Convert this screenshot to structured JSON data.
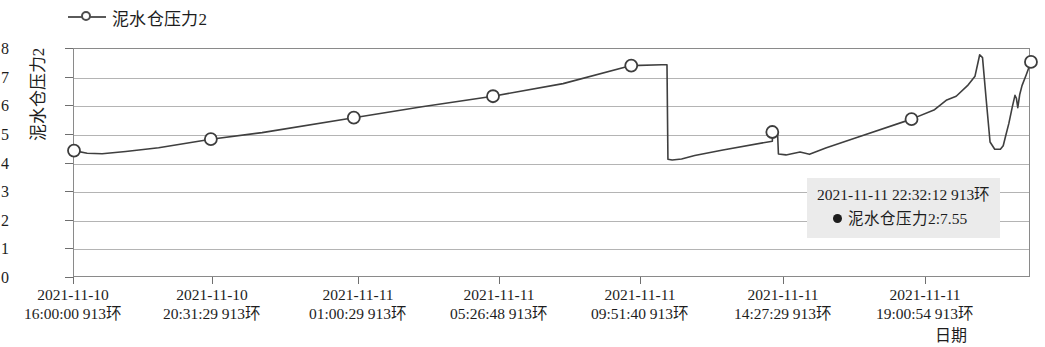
{
  "legend": {
    "items": [
      {
        "label": "泥水仓压力2",
        "marker": "line-circle-marker",
        "color": "#4d4d4d"
      }
    ]
  },
  "axes": {
    "y_title": "泥水仓压力2",
    "x_title": "日期",
    "y_ticks": [
      "0",
      "1",
      "2",
      "3",
      "4",
      "5",
      "6",
      "7",
      "8"
    ],
    "x_ticks": [
      {
        "line1": "2021-11-10",
        "line2": "16:00:00  913环"
      },
      {
        "line1": "2021-11-10",
        "line2": "20:31:29  913环"
      },
      {
        "line1": "2021-11-11",
        "line2": "01:00:29  913环"
      },
      {
        "line1": "2021-11-11",
        "line2": "05:26:48  913环"
      },
      {
        "line1": "2021-11-11",
        "line2": "09:51:40  913环"
      },
      {
        "line1": "2021-11-11",
        "line2": "14:27:29  913环"
      },
      {
        "line1": "2021-11-11",
        "line2": "19:00:54  913环"
      }
    ]
  },
  "tooltip": {
    "header": "2021-11-11  22:32:12  913环",
    "series_name": "泥水仓压力2",
    "value": "7.55",
    "body": "泥水仓压力2:7.55",
    "background": "#ebebeb"
  },
  "chart_data": {
    "type": "line",
    "title": "",
    "xlabel": "日期",
    "ylabel": "泥水仓压力2",
    "ylim": [
      0,
      8
    ],
    "ytick_values": [
      0,
      1,
      2,
      3,
      4,
      5,
      6,
      7,
      8
    ],
    "grid": true,
    "legend_position": "top-left",
    "categories": [
      "2021-11-10 16:00:00 913环",
      "2021-11-10 20:31:29 913环",
      "2021-11-11 01:00:29 913环",
      "2021-11-11 05:26:48 913环",
      "2021-11-11 09:51:40 913环",
      "2021-11-11 14:27:29 913环",
      "2021-11-11 19:00:54 913环"
    ],
    "series": [
      {
        "name": "泥水仓压力2",
        "color": "#3f3f3f",
        "marker_values": [
          4.45,
          4.85,
          5.6,
          6.35,
          7.42,
          5.1,
          5.55
        ],
        "x_fraction": [
          0.0,
          0.1455,
          0.2975,
          0.4455,
          0.5925,
          0.7425,
          0.8905
        ],
        "points": [
          {
            "t": 0.0,
            "v": 4.45
          },
          {
            "t": 0.014,
            "v": 4.36
          },
          {
            "t": 0.03,
            "v": 4.34
          },
          {
            "t": 0.055,
            "v": 4.42
          },
          {
            "t": 0.09,
            "v": 4.55
          },
          {
            "t": 0.1455,
            "v": 4.85
          },
          {
            "t": 0.2,
            "v": 5.08
          },
          {
            "t": 0.2975,
            "v": 5.6
          },
          {
            "t": 0.37,
            "v": 5.98
          },
          {
            "t": 0.4455,
            "v": 6.35
          },
          {
            "t": 0.52,
            "v": 6.79
          },
          {
            "t": 0.5925,
            "v": 7.42
          },
          {
            "t": 0.625,
            "v": 7.45
          },
          {
            "t": 0.6305,
            "v": 7.45
          },
          {
            "t": 0.6315,
            "v": 4.15
          },
          {
            "t": 0.636,
            "v": 4.12
          },
          {
            "t": 0.646,
            "v": 4.16
          },
          {
            "t": 0.66,
            "v": 4.28
          },
          {
            "t": 0.69,
            "v": 4.47
          },
          {
            "t": 0.7425,
            "v": 4.78
          },
          {
            "t": 0.743,
            "v": 5.1
          },
          {
            "t": 0.748,
            "v": 5.12
          },
          {
            "t": 0.749,
            "v": 4.33
          },
          {
            "t": 0.757,
            "v": 4.3
          },
          {
            "t": 0.772,
            "v": 4.4
          },
          {
            "t": 0.782,
            "v": 4.32
          },
          {
            "t": 0.8,
            "v": 4.55
          },
          {
            "t": 0.83,
            "v": 4.88
          },
          {
            "t": 0.8905,
            "v": 5.55
          },
          {
            "t": 0.915,
            "v": 5.88
          },
          {
            "t": 0.928,
            "v": 6.22
          },
          {
            "t": 0.938,
            "v": 6.35
          },
          {
            "t": 0.95,
            "v": 6.72
          },
          {
            "t": 0.958,
            "v": 7.05
          },
          {
            "t": 0.963,
            "v": 7.8
          },
          {
            "t": 0.966,
            "v": 7.7
          },
          {
            "t": 0.97,
            "v": 6.2
          },
          {
            "t": 0.974,
            "v": 4.75
          },
          {
            "t": 0.979,
            "v": 4.5
          },
          {
            "t": 0.985,
            "v": 4.5
          },
          {
            "t": 0.988,
            "v": 4.62
          },
          {
            "t": 0.9905,
            "v": 4.95
          },
          {
            "t": 0.994,
            "v": 5.4
          },
          {
            "t": 0.9975,
            "v": 5.95
          },
          {
            "t": 1.0005,
            "v": 6.38
          },
          {
            "t": 1.002,
            "v": 6.28
          },
          {
            "t": 1.0035,
            "v": 5.95
          },
          {
            "t": 1.0055,
            "v": 6.4
          },
          {
            "t": 1.008,
            "v": 6.72
          },
          {
            "t": 1.0125,
            "v": 7.1
          },
          {
            "t": 1.0175,
            "v": 7.55
          }
        ],
        "final_marker": {
          "t": 1.0175,
          "v": 7.55
        }
      }
    ],
    "annotations": [
      {
        "type": "tooltip",
        "header": "2021-11-11  22:32:12  913环",
        "series": "泥水仓压力2",
        "value": 7.55
      }
    ]
  }
}
